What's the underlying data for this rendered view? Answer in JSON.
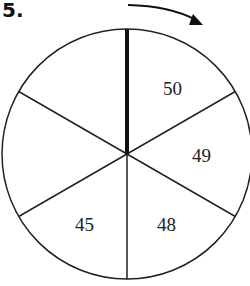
{
  "problem_number": "5.",
  "spinner": {
    "sections": 6,
    "labels": [
      {
        "value": "50",
        "position": "upper-right"
      },
      {
        "value": "49",
        "position": "right"
      },
      {
        "value": "48",
        "position": "lower-right"
      },
      {
        "value": "45",
        "position": "lower-left"
      },
      {
        "value": "",
        "position": "left"
      },
      {
        "value": "",
        "position": "upper-left"
      }
    ],
    "pointer": "thick vertical line at top",
    "rotation_direction": "clockwise"
  }
}
